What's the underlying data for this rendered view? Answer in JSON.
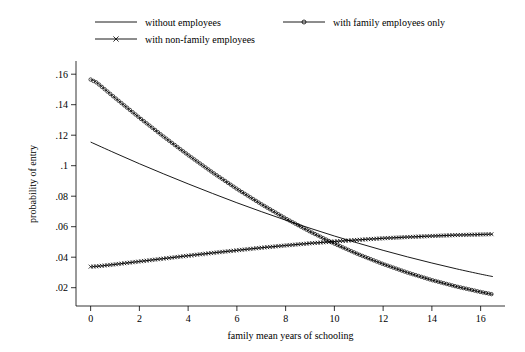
{
  "chart_data": {
    "type": "line",
    "title": "",
    "xlabel": "family mean years of schooling",
    "ylabel": "probability of entry",
    "xlim": [
      -0.6,
      17.0
    ],
    "ylim": [
      0.008,
      0.168
    ],
    "xticks": [
      0,
      2,
      4,
      6,
      8,
      10,
      12,
      14,
      16
    ],
    "xtick_labels": [
      "0",
      "2",
      "4",
      "6",
      "8",
      "10",
      "12",
      "14",
      "16"
    ],
    "yticks": [
      0.02,
      0.04,
      0.06,
      0.08,
      0.1,
      0.12,
      0.14,
      0.16
    ],
    "ytick_labels": [
      ".02",
      ".04",
      ".06",
      ".08",
      ".1",
      ".12",
      ".14",
      ".16"
    ],
    "grid": false,
    "legend_position": "top",
    "series": [
      {
        "name": "without employees",
        "marker": "none",
        "x": [
          0,
          1,
          2,
          3,
          4,
          5,
          6,
          7,
          8,
          9,
          10,
          11,
          12,
          13,
          14,
          15,
          16,
          16.5
        ],
        "values": [
          0.1155,
          0.1083,
          0.1013,
          0.0946,
          0.0881,
          0.0818,
          0.0757,
          0.0699,
          0.0643,
          0.059,
          0.0539,
          0.0491,
          0.0445,
          0.0402,
          0.0362,
          0.0324,
          0.0289,
          0.0273
        ]
      },
      {
        "name": "with family employees only",
        "marker": "circle",
        "x": [
          0,
          0.25,
          1,
          2,
          3,
          4,
          5,
          6,
          7,
          8,
          9,
          10,
          11,
          12,
          13,
          14,
          15,
          16,
          16.5
        ],
        "values": [
          0.1565,
          0.1545,
          0.1445,
          0.1315,
          0.119,
          0.107,
          0.0956,
          0.0848,
          0.0748,
          0.0654,
          0.0568,
          0.0489,
          0.0418,
          0.0355,
          0.0299,
          0.025,
          0.0208,
          0.0172,
          0.0156
        ]
      },
      {
        "name": "with non-family employees",
        "marker": "cross",
        "x": [
          0,
          0.25,
          1,
          2,
          3,
          4,
          5,
          6,
          7,
          8,
          9,
          10,
          11,
          12,
          13,
          14,
          15,
          16,
          16.5
        ],
        "values": [
          0.0338,
          0.034,
          0.0353,
          0.0372,
          0.0391,
          0.041,
          0.0428,
          0.0445,
          0.0462,
          0.0477,
          0.0491,
          0.0503,
          0.0514,
          0.0524,
          0.0532,
          0.0539,
          0.0545,
          0.0549,
          0.0551
        ]
      }
    ]
  },
  "legend": {
    "items": [
      {
        "label": "without employees",
        "marker": "none"
      },
      {
        "label": "with family employees only",
        "marker": "circle"
      },
      {
        "label": "with non-family employees",
        "marker": "cross"
      }
    ]
  },
  "axes": {
    "x_title": "family mean years of schooling",
    "y_title": "probability of entry"
  },
  "style": {
    "line_color": "#000000",
    "background": "#ffffff",
    "axis_color": "#000000"
  }
}
